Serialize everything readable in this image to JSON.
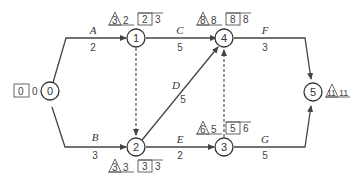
{
  "diagram": {
    "type": "activity-on-arrow network",
    "nodes": [
      {
        "id": "0",
        "label": "0",
        "earliest": "0",
        "latest": "0"
      },
      {
        "id": "1",
        "label": "1",
        "tri": "3",
        "tri_val": "2",
        "box_left": "2",
        "box_right": "3"
      },
      {
        "id": "2",
        "label": "2",
        "tri": "3",
        "tri_val": "3",
        "box_left": "3",
        "box_right": "3"
      },
      {
        "id": "3",
        "label": "3",
        "tri": "6",
        "tri_val": "5",
        "box_left": "5",
        "box_right": "6"
      },
      {
        "id": "4",
        "label": "4",
        "tri": "8",
        "tri_val": "8",
        "box_left": "8",
        "box_right": "8"
      },
      {
        "id": "5",
        "label": "5",
        "tri": "11",
        "tri_val": "11"
      }
    ],
    "edges": [
      {
        "name": "A",
        "duration": "2",
        "from": "0",
        "to": "1"
      },
      {
        "name": "B",
        "duration": "3",
        "from": "0",
        "to": "2"
      },
      {
        "name": "C",
        "duration": "5",
        "from": "1",
        "to": "4"
      },
      {
        "name": "D",
        "duration": "5",
        "from": "2",
        "to": "4"
      },
      {
        "name": "E",
        "duration": "2",
        "from": "2",
        "to": "3"
      },
      {
        "name": "F",
        "duration": "3",
        "from": "4",
        "to": "5"
      },
      {
        "name": "G",
        "duration": "5",
        "from": "3",
        "to": "5"
      }
    ],
    "dummy_edges": [
      {
        "from": "1",
        "to": "2"
      },
      {
        "from": "3",
        "to": "4"
      }
    ]
  }
}
